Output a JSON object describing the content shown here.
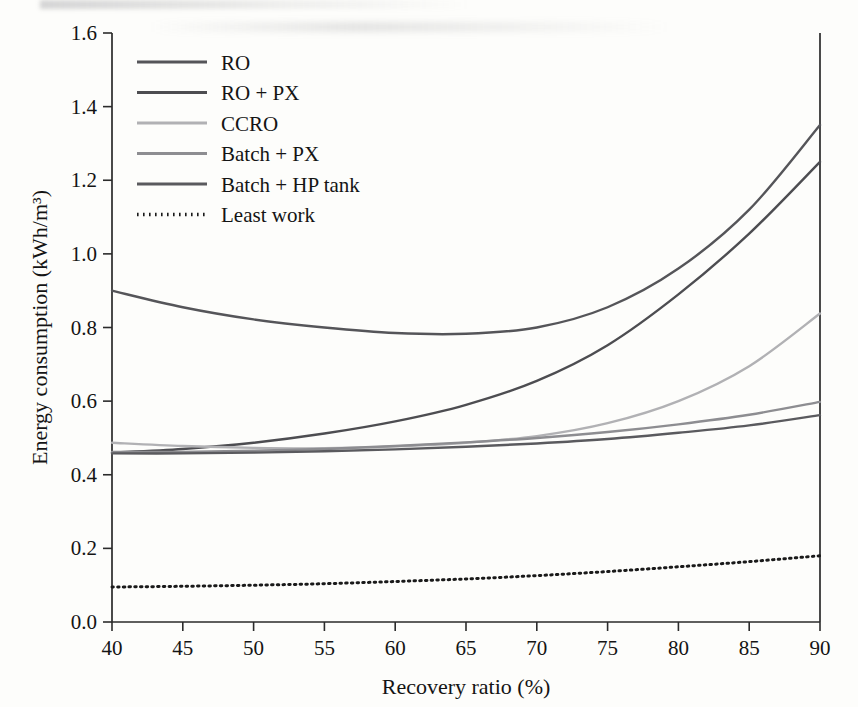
{
  "chart_data": {
    "type": "line",
    "title": "",
    "xlabel": "Recovery ratio (%)",
    "ylabel": "Energy consumption (kWh/m³)",
    "xlim": [
      40,
      90
    ],
    "ylim": [
      0.0,
      1.6
    ],
    "xticks": [
      40,
      45,
      50,
      55,
      60,
      65,
      70,
      75,
      80,
      85,
      90
    ],
    "xtick_labels": [
      "40",
      "45",
      "50",
      "55",
      "60",
      "65",
      "70",
      "75",
      "80",
      "85",
      "90"
    ],
    "yticks": [
      0.0,
      0.2,
      0.4,
      0.6,
      0.8,
      1.0,
      1.2,
      1.4,
      1.6
    ],
    "ytick_labels": [
      "0.0",
      "0.2",
      "0.4",
      "0.6",
      "0.8",
      "1.0",
      "1.2",
      "1.4",
      "1.6"
    ],
    "grid": false,
    "legend_position": "upper-left",
    "x": [
      40,
      45,
      50,
      55,
      60,
      65,
      70,
      75,
      80,
      85,
      90
    ],
    "series": [
      {
        "name": "RO",
        "color": "#555559",
        "width": 2.4,
        "dash": "",
        "values": [
          0.9,
          0.855,
          0.822,
          0.8,
          0.785,
          0.783,
          0.8,
          0.855,
          0.96,
          1.12,
          1.35
        ]
      },
      {
        "name": "RO + PX",
        "color": "#4d4d51",
        "width": 2.4,
        "dash": "",
        "values": [
          0.46,
          0.47,
          0.487,
          0.512,
          0.545,
          0.59,
          0.655,
          0.752,
          0.89,
          1.055,
          1.25
        ]
      },
      {
        "name": "CCRO",
        "color": "#b1b1b4",
        "width": 2.4,
        "dash": "",
        "values": [
          0.487,
          0.478,
          0.473,
          0.472,
          0.477,
          0.487,
          0.505,
          0.54,
          0.6,
          0.695,
          0.838
        ]
      },
      {
        "name": "Batch + PX",
        "color": "#8d8d91",
        "width": 2.4,
        "dash": "",
        "values": [
          0.462,
          0.462,
          0.465,
          0.47,
          0.478,
          0.488,
          0.5,
          0.516,
          0.537,
          0.563,
          0.598
        ]
      },
      {
        "name": "Batch + HP tank",
        "color": "#5a5a5e",
        "width": 2.4,
        "dash": "",
        "values": [
          0.458,
          0.458,
          0.46,
          0.464,
          0.469,
          0.476,
          0.485,
          0.497,
          0.514,
          0.534,
          0.562
        ]
      },
      {
        "name": "Least work",
        "color": "#1a1a1a",
        "width": 3.0,
        "dash": "1.5 4.2",
        "values": [
          0.095,
          0.097,
          0.1,
          0.104,
          0.11,
          0.117,
          0.126,
          0.137,
          0.15,
          0.164,
          0.18
        ]
      }
    ]
  },
  "legend": {
    "entries": [
      {
        "label": "RO"
      },
      {
        "label": "RO + PX"
      },
      {
        "label": "CCRO"
      },
      {
        "label": "Batch + PX"
      },
      {
        "label": "Batch + HP tank"
      },
      {
        "label": "Least work"
      }
    ]
  }
}
